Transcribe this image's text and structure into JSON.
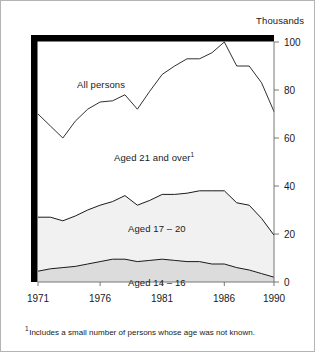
{
  "figure": {
    "unit_label": "Thousands",
    "footnote_marker": "1",
    "footnote_text": "Includes a small number of persons whose age was not known."
  },
  "labels": {
    "all_persons": "All persons",
    "aged_21_over": "Aged 21 and over",
    "aged_21_over_marker": "1",
    "aged_17_20": "Aged 17 – 20",
    "aged_14_16": "Aged 14 – 16"
  },
  "colors": {
    "frame": "#000000",
    "outer_border": "#b4b4b4",
    "line": "#1a1a1a",
    "band_17_20_fill": "#f1f1f1",
    "band_14_16_fill": "#dcdcdc",
    "background": "#ffffff"
  },
  "chart_data": {
    "type": "area",
    "title": "",
    "subtitle": "",
    "xlabel": "",
    "ylabel": "Thousands",
    "xlim": [
      1971,
      1990
    ],
    "ylim": [
      0,
      100
    ],
    "yticks": [
      0,
      20,
      40,
      60,
      80,
      100
    ],
    "ytick_labels": [
      "0",
      "20",
      "40",
      "60",
      "80",
      "100"
    ],
    "xticks": [
      1971,
      1976,
      1981,
      1986,
      1990
    ],
    "xtick_labels": [
      "1971",
      "1976",
      "1981",
      "1986",
      "1990"
    ],
    "grid": false,
    "legend": "inline-annotations",
    "stacked": true,
    "x": [
      1971,
      1972,
      1973,
      1974,
      1975,
      1976,
      1977,
      1978,
      1979,
      1980,
      1981,
      1982,
      1983,
      1984,
      1985,
      1986,
      1987,
      1988,
      1989,
      1990
    ],
    "series": [
      {
        "name": "Aged 14 – 16",
        "values": [
          4.5,
          5.5,
          6.0,
          6.5,
          7.5,
          8.5,
          9.5,
          9.5,
          8.5,
          9.0,
          9.5,
          9.0,
          8.5,
          8.5,
          7.5,
          7.5,
          6.0,
          5.0,
          3.5,
          2.0
        ]
      },
      {
        "name": "Aged 17 – 20",
        "values": [
          22.5,
          21.5,
          19.5,
          21.0,
          22.5,
          23.5,
          24.0,
          26.5,
          23.5,
          25.0,
          27.0,
          27.5,
          28.5,
          29.5,
          30.5,
          30.5,
          27.0,
          27.0,
          23.0,
          17.5
        ]
      },
      {
        "name": "Aged 21 and over",
        "values": [
          43.0,
          38.0,
          34.5,
          39.5,
          42.0,
          43.0,
          42.0,
          42.0,
          40.0,
          45.5,
          50.0,
          53.5,
          56.0,
          55.0,
          57.5,
          62.0,
          57.0,
          58.0,
          56.5,
          51.5
        ]
      }
    ],
    "total_line": {
      "name": "All persons",
      "values": [
        70.0,
        65.0,
        60.0,
        67.0,
        72.0,
        75.0,
        75.5,
        78.0,
        72.0,
        79.5,
        86.5,
        90.0,
        93.0,
        93.0,
        95.5,
        100.0,
        90.0,
        90.0,
        83.0,
        71.0
      ]
    },
    "cumulative_boundaries": {
      "aged_14_16_top": [
        4.5,
        5.5,
        6.0,
        6.5,
        7.5,
        8.5,
        9.5,
        9.5,
        8.5,
        9.0,
        9.5,
        9.0,
        8.5,
        8.5,
        7.5,
        7.5,
        6.0,
        5.0,
        3.5,
        2.0
      ],
      "aged_17_20_top": [
        27.0,
        27.0,
        25.5,
        27.5,
        30.0,
        32.0,
        33.5,
        36.0,
        32.0,
        34.0,
        36.5,
        36.5,
        37.0,
        38.0,
        38.0,
        38.0,
        33.0,
        32.0,
        26.5,
        19.5
      ],
      "all_persons_top": [
        70.0,
        65.0,
        60.0,
        67.0,
        72.0,
        75.0,
        75.5,
        78.0,
        72.0,
        79.5,
        86.5,
        90.0,
        93.0,
        93.0,
        95.5,
        100.0,
        90.0,
        90.0,
        83.0,
        71.0
      ]
    }
  }
}
